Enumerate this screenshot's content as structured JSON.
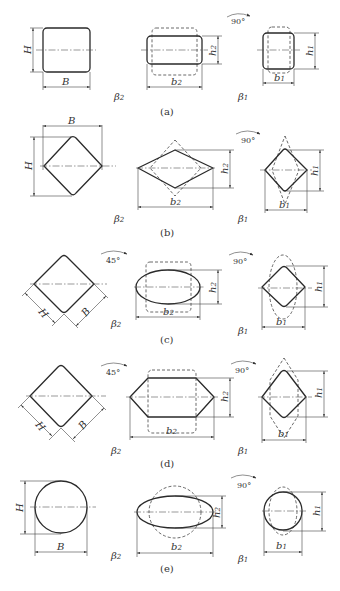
{
  "figure": {
    "rows": [
      {
        "caption": "(a)",
        "initial_shape": "square",
        "pass2_shape": "flat rectangle",
        "pass1_shape": "square",
        "rotation1": "",
        "rotation2": "90°"
      },
      {
        "caption": "(b)",
        "initial_shape": "diamond",
        "pass2_shape": "flat rhombus",
        "pass1_shape": "diamond",
        "rotation1": "",
        "rotation2": "90°"
      },
      {
        "caption": "(c)",
        "initial_shape": "square rotated 45°",
        "pass2_shape": "oval",
        "pass1_shape": "diamond",
        "rotation1": "45°",
        "rotation2": "90°"
      },
      {
        "caption": "(d)",
        "initial_shape": "square rotated 45°",
        "pass2_shape": "hexagon",
        "pass1_shape": "diamond",
        "rotation1": "45°",
        "rotation2": "90°"
      },
      {
        "caption": "(e)",
        "initial_shape": "circle",
        "pass2_shape": "oval",
        "pass1_shape": "circle",
        "rotation1": "",
        "rotation2": "90°"
      }
    ]
  },
  "labels": {
    "H": "H",
    "B": "B",
    "h": "h",
    "b": "b",
    "beta": "β",
    "sub1": "1",
    "sub2": "2",
    "rot45": "45°",
    "rot90": "90°"
  },
  "captions": [
    "(a)",
    "(b)",
    "(c)",
    "(d)",
    "(e)"
  ]
}
